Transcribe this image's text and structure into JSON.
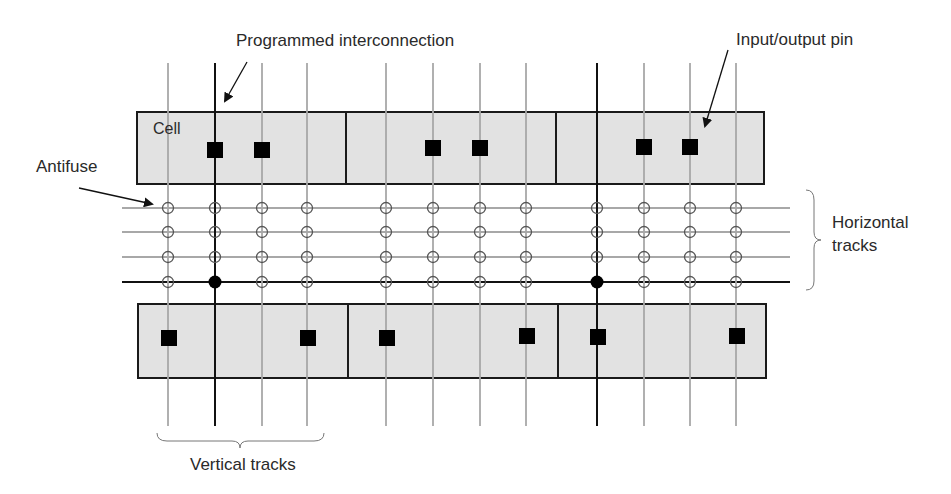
{
  "labels": {
    "programmed_interconnection": "Programmed interconnection",
    "input_output_pin": "Input/output pin",
    "cell": "Cell",
    "antifuse": "Antifuse",
    "horizontal_tracks_line1": "Horizontal",
    "horizontal_tracks_line2": "tracks",
    "vertical_tracks": "Vertical tracks"
  },
  "colors": {
    "cell_fill": "#e2e2e2",
    "cell_border": "#1a1a1a",
    "track_gray": "#a8a8a8",
    "track_programmed": "#111111",
    "pin": "#000000",
    "antifuse_stroke": "#555555"
  },
  "vertical_tracks_x": [
    168,
    215,
    262,
    307,
    386,
    433,
    480,
    526,
    597,
    644,
    690,
    736
  ],
  "programmed_vertical_x": [
    215,
    597
  ],
  "horizontal_tracks_y": [
    208,
    232,
    257,
    282
  ],
  "programmed_horizontal_y": 282,
  "programmed_antifuses": [
    [
      215,
      282
    ],
    [
      597,
      282
    ]
  ],
  "top_cells": [
    {
      "x": 137,
      "y": 112,
      "w": 209,
      "h": 72
    },
    {
      "x": 346,
      "y": 112,
      "w": 210,
      "h": 72
    },
    {
      "x": 556,
      "y": 112,
      "w": 208,
      "h": 72
    }
  ],
  "bottom_cells": [
    {
      "x": 138,
      "y": 304,
      "w": 210,
      "h": 74
    },
    {
      "x": 348,
      "y": 304,
      "w": 210,
      "h": 74
    },
    {
      "x": 558,
      "y": 304,
      "w": 208,
      "h": 74
    }
  ],
  "pins": [
    [
      215,
      150
    ],
    [
      262,
      150
    ],
    [
      433,
      148
    ],
    [
      480,
      148
    ],
    [
      644,
      147
    ],
    [
      690,
      147
    ],
    [
      169,
      338
    ],
    [
      308,
      338
    ],
    [
      387,
      338
    ],
    [
      527,
      336
    ],
    [
      598,
      337
    ],
    [
      737,
      336
    ]
  ]
}
